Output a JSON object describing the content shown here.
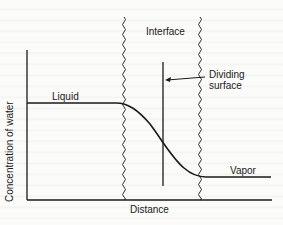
{
  "diagram": {
    "title": "",
    "labels": {
      "interface": "Interface",
      "dividing_surface_line1": "Dividing",
      "dividing_surface_line2": "surface",
      "liquid": "Liquid",
      "vapor": "Vapor",
      "x_axis": "Distance",
      "y_axis": "Concentration of water"
    },
    "colors": {
      "line": "#1a1a1a",
      "background": "#fbfbfa"
    },
    "elements": [
      "y-axis",
      "x-axis",
      "liquid-concentration-plateau",
      "transition-curve",
      "vapor-concentration-plateau",
      "left-interface-boundary (wavy)",
      "right-interface-boundary (wavy)",
      "dividing-surface (vertical line)",
      "arrow pointing to dividing surface"
    ]
  }
}
